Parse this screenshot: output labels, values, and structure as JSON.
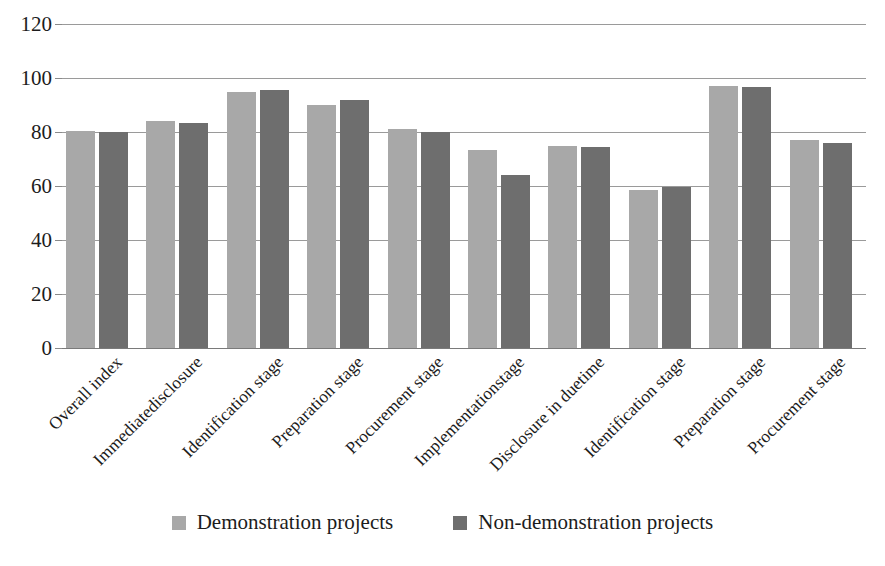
{
  "chart_data": {
    "type": "bar",
    "title": "",
    "xlabel": "",
    "ylabel": "",
    "ylim": [
      0,
      120
    ],
    "yticks": [
      0,
      20,
      40,
      60,
      80,
      100,
      120
    ],
    "grid": true,
    "legend_position": "bottom",
    "categories": [
      "Overall index",
      "Immediatedisclosure",
      "Identification stage",
      "Preparation stage",
      "Procurement stage",
      "Implementationstage",
      "Disclosure in duetime",
      "Identification stage",
      "Preparation stage",
      "Procurement stage"
    ],
    "series": [
      {
        "name": "Demonstration projects",
        "color": "#a8a8a8",
        "values": [
          80.5,
          84,
          95,
          90,
          81,
          73.5,
          75,
          58.5,
          97,
          77
        ]
      },
      {
        "name": "Non-demonstration projects",
        "color": "#6e6e6e",
        "values": [
          80,
          83.5,
          95.5,
          92,
          80,
          64,
          74.5,
          59.5,
          96.5,
          76
        ]
      }
    ]
  },
  "legend": {
    "items": [
      {
        "label": "Demonstration projects",
        "color": "#a8a8a8"
      },
      {
        "label": "Non-demonstration projects",
        "color": "#6e6e6e"
      }
    ]
  },
  "axis": {
    "y_tick_labels": [
      "120",
      "100",
      "80",
      "60",
      "40",
      "20",
      "0"
    ]
  }
}
